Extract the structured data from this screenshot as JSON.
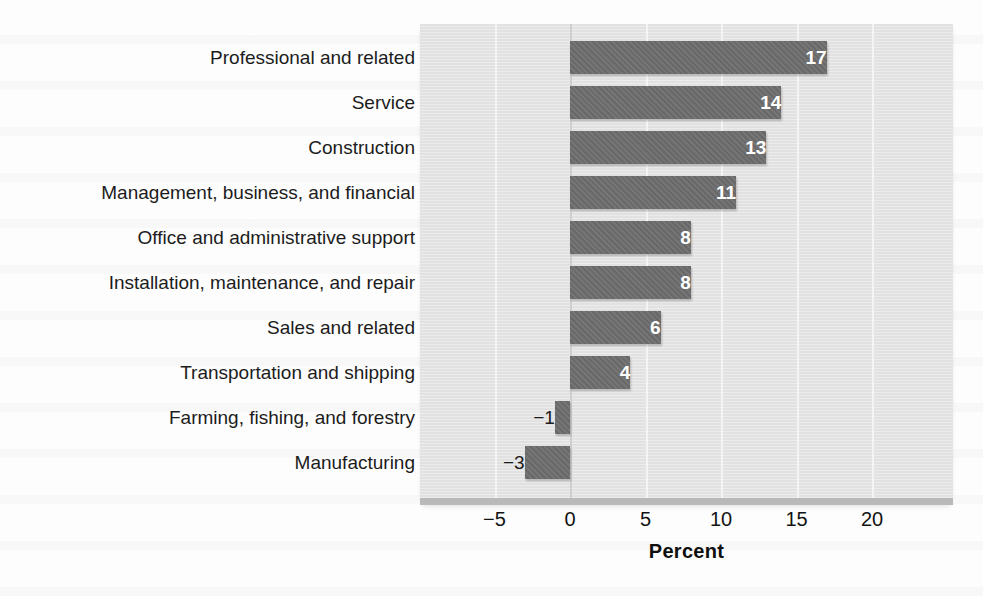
{
  "chart_data": {
    "type": "bar",
    "orientation": "horizontal",
    "title": "",
    "subtitle": "",
    "xlabel": "Percent",
    "ylabel": "",
    "categories": [
      "Professional and related",
      "Service",
      "Construction",
      "Management, business, and financial",
      "Office and administrative support",
      "Installation, maintenance, and repair",
      "Sales and related",
      "Transportation and shipping",
      "Farming, fishing, and forestry",
      "Manufacturing"
    ],
    "values": [
      17,
      14,
      13,
      11,
      8,
      8,
      6,
      4,
      -1,
      -3
    ],
    "data_labels": [
      "17",
      "14",
      "13",
      "11",
      "8",
      "8",
      "6",
      "4",
      "−1",
      "−3"
    ],
    "xticks": [
      -5,
      0,
      5,
      10,
      15,
      20
    ],
    "xtick_labels": [
      "−5",
      "0",
      "5",
      "10",
      "15",
      "20"
    ],
    "xlim": [
      -8,
      27.5
    ],
    "grid": "vertical",
    "legend": "none",
    "bar_color": "#6e6e6e",
    "plot_background": "#e4e4e4",
    "gridline_color": "#f4f4f4",
    "zero_line_color": "#cfcfcf",
    "label_text_color_inside": "#ffffff",
    "label_text_color_outside": "#1a1a1a"
  }
}
